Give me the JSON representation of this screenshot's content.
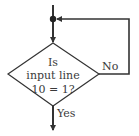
{
  "diagram": {
    "type": "flowchart-decision",
    "decision": {
      "lines": [
        "Is",
        "input line",
        "10 = 1?"
      ]
    },
    "branches": {
      "no_label": "No",
      "yes_label": "Yes"
    },
    "colors": {
      "stroke": "#333333",
      "text": "#3a3a3a",
      "background": "#ffffff"
    }
  }
}
